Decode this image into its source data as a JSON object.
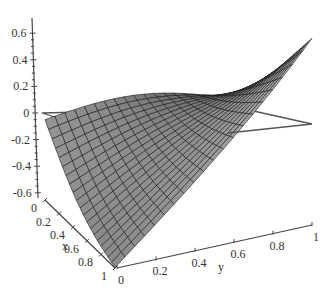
{
  "chart_data": {
    "type": "surface3d",
    "title": "",
    "xlabel": "x",
    "ylabel": "y",
    "zlabel": "",
    "x_range": [
      0,
      1
    ],
    "y_range": [
      0,
      1
    ],
    "z_range": [
      -0.65,
      0.65
    ],
    "x_ticks": [
      "0",
      "0.2",
      "0.4",
      "0.6",
      "0.8",
      "1"
    ],
    "y_ticks": [
      "0",
      "0.2",
      "0.4",
      "0.6",
      "0.8",
      "1"
    ],
    "z_ticks": [
      "0.6",
      "0.4",
      "0.2",
      "0",
      "-0.2",
      "-0.4",
      "-0.6"
    ],
    "grid_resolution": [
      20,
      20
    ],
    "reference_plane": {
      "z": 0,
      "style": "outline"
    },
    "surface_color": "#6e6e6e",
    "mesh_color": "#1a1a1a",
    "corner_values": {
      "x0_y0": -0.05,
      "x1_y0": -0.65,
      "x0_y1": -0.23,
      "x1_y1": 0.6
    }
  },
  "axes": {
    "x_label": "x",
    "y_label": "y",
    "z_tick_labels": [
      "0.6",
      "0.4",
      "0.2",
      "0",
      "-0.2",
      "-0.4",
      "-0.6"
    ],
    "x_tick_labels": [
      "0",
      "0.2",
      "0.4",
      "0.6",
      "0.8",
      "1"
    ],
    "y_tick_labels": [
      "0",
      "0.2",
      "0.4",
      "0.6",
      "0.8",
      "1"
    ]
  }
}
